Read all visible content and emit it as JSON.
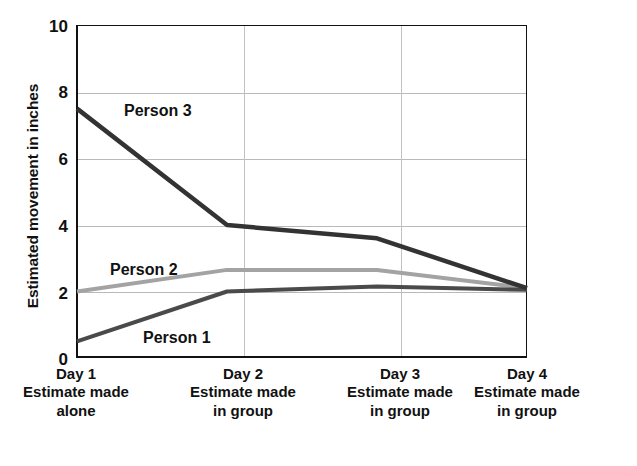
{
  "chart_data": {
    "type": "line",
    "title": "",
    "xlabel": "",
    "ylabel": "Estimated movement in inches",
    "ylim": [
      0,
      10
    ],
    "yticks": [
      0,
      2,
      4,
      6,
      8,
      10
    ],
    "grid": true,
    "legend_position": "inline-labels",
    "categories": [
      "Day 1",
      "Day 2",
      "Day 3",
      "Day 4"
    ],
    "category_sublabels": [
      "Estimate made alone",
      "Estimate made in group",
      "Estimate made in group",
      "Estimate made in group"
    ],
    "series": [
      {
        "name": "Person 1",
        "values": [
          0.5,
          2.0,
          2.15,
          2.05
        ],
        "color": "#4a4a4a"
      },
      {
        "name": "Person 2",
        "values": [
          2.0,
          2.65,
          2.65,
          2.1
        ],
        "color": "#a3a3a3"
      },
      {
        "name": "Person 3",
        "values": [
          7.5,
          4.0,
          3.6,
          2.1
        ],
        "color": "#333333"
      }
    ]
  },
  "axis": {
    "y_title": "Estimated movement in inches",
    "y_tick_labels": [
      "10",
      "8",
      "6",
      "4",
      "2",
      "0"
    ]
  },
  "x_axis": {
    "columns": [
      {
        "day": "Day 1",
        "line1": "Estimate made",
        "line2": "alone"
      },
      {
        "day": "Day 2",
        "line1": "Estimate made",
        "line2": "in group"
      },
      {
        "day": "Day 3",
        "line1": "Estimate made",
        "line2": "in group"
      },
      {
        "day": "Day 4",
        "line1": "Estimate made",
        "line2": "in group"
      }
    ]
  },
  "series_labels": {
    "person3": "Person 3",
    "person2": "Person 2",
    "person1": "Person 1"
  }
}
